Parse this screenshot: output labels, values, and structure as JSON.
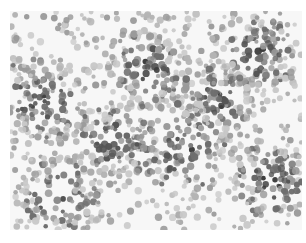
{
  "image": {
    "kind": "grayscale micrograph",
    "description": "Dense field of small round particles/cells in varying shades of gray on a pale background",
    "width": 306,
    "height": 243,
    "field": {
      "x": 10,
      "y": 11,
      "width": 292,
      "height": 219
    },
    "colors": {
      "background": "#f7f7f7",
      "margin": "#ffffff",
      "dark_particle": "#3a3a3a",
      "mid_particle": "#6e6e6e",
      "light_particle": "#b4b4b4"
    },
    "particle_count_approx": 1400,
    "dense_regions": [
      {
        "cx": 40,
        "cy": 100,
        "r": 45
      },
      {
        "cx": 150,
        "cy": 70,
        "r": 40
      },
      {
        "cx": 260,
        "cy": 50,
        "r": 40
      },
      {
        "cx": 180,
        "cy": 150,
        "r": 50
      },
      {
        "cx": 60,
        "cy": 200,
        "r": 45
      },
      {
        "cx": 270,
        "cy": 180,
        "r": 40
      },
      {
        "cx": 110,
        "cy": 140,
        "r": 35
      },
      {
        "cx": 220,
        "cy": 100,
        "r": 35
      }
    ]
  }
}
